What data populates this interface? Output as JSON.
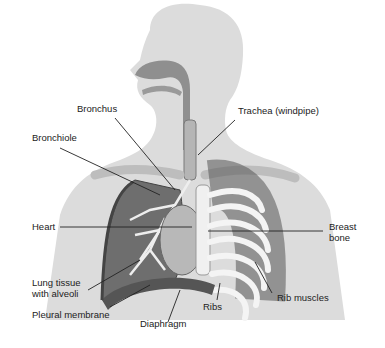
{
  "diagram": {
    "labels": {
      "bronchus": "Bronchus",
      "trachea": "Trachea (windpipe)",
      "bronchiole": "Bronchiole",
      "heart": "Heart",
      "breast_bone_1": "Breast",
      "breast_bone_2": "bone",
      "lung_tissue_1": "Lung tissue",
      "lung_tissue_2": "with alveoli",
      "pleural_membrane": "Pleural membrane",
      "diaphragm": "Diaphragm",
      "ribs": "Ribs",
      "rib_muscles": "Rib muscles"
    },
    "colors": {
      "silhouette": "#d9d9d9",
      "airway": "#8e8e8e",
      "lung": "#6f6f6f",
      "rib": "#f2f2f2",
      "leader_line": "#222222"
    }
  }
}
